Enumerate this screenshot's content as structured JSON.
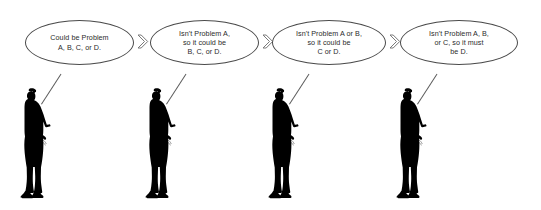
{
  "diagram": {
    "background_color": "#ffffff",
    "bubble_outline_color": "#4a4a4a",
    "text_color": "#2b2b2b",
    "figure_color": "#000000",
    "arrow_color": "#6b6b6b",
    "panels": [
      {
        "index": 1,
        "bubble_text": "Could be Problem\nA, B, C, or D.",
        "figure_name": "businessperson-silhouette",
        "has_arrow_after": true
      },
      {
        "index": 2,
        "bubble_text": "Isn't Problem A,\nso it could be\nB, C, or D.",
        "figure_name": "businessperson-silhouette",
        "has_arrow_after": true
      },
      {
        "index": 3,
        "bubble_text": "Isn't Problem A or B,\nso it could be\nC or D.",
        "figure_name": "businessperson-silhouette",
        "has_arrow_after": true
      },
      {
        "index": 4,
        "bubble_text": "Isn't Problem A, B,\nor C, so it must\nbe  D.",
        "figure_name": "businessperson-silhouette",
        "has_arrow_after": false
      }
    ],
    "arrow_icon_name": "chevron-right-arrow-icon"
  }
}
